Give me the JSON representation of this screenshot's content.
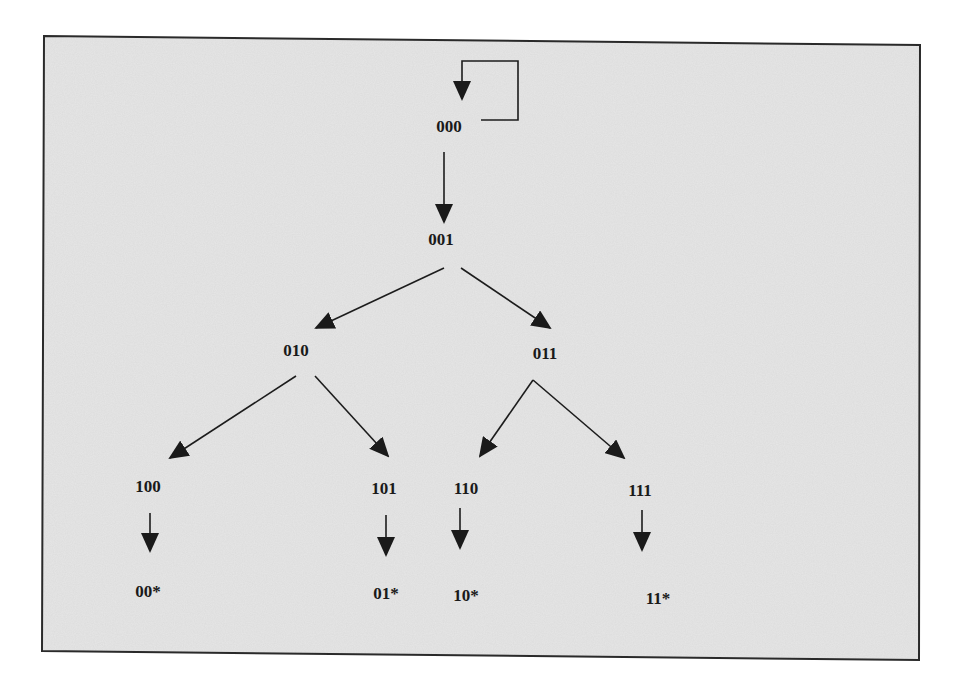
{
  "diagram": {
    "type": "state-transition-tree",
    "colors": {
      "background": "#dcdcdc",
      "page": "#ffffff",
      "ink": "#1a1a1a"
    },
    "nodes": [
      {
        "id": "n000",
        "label": "000",
        "x": 449,
        "y": 128
      },
      {
        "id": "n001",
        "label": "001",
        "x": 441,
        "y": 241
      },
      {
        "id": "n010",
        "label": "010",
        "x": 296,
        "y": 352
      },
      {
        "id": "n011",
        "label": "011",
        "x": 545,
        "y": 355
      },
      {
        "id": "n100",
        "label": "100",
        "x": 148,
        "y": 488
      },
      {
        "id": "n101",
        "label": "101",
        "x": 384,
        "y": 490
      },
      {
        "id": "n110",
        "label": "110",
        "x": 466,
        "y": 490
      },
      {
        "id": "n111",
        "label": "111",
        "x": 640,
        "y": 492
      },
      {
        "id": "n00s",
        "label": "00*",
        "x": 148,
        "y": 593
      },
      {
        "id": "n01s",
        "label": "01*",
        "x": 386,
        "y": 595
      },
      {
        "id": "n10s",
        "label": "10*",
        "x": 466,
        "y": 597
      },
      {
        "id": "n11s",
        "label": "11*",
        "x": 658,
        "y": 600
      }
    ],
    "edges": [
      {
        "from": "000",
        "to": "000",
        "kind": "self-loop"
      },
      {
        "from": "000",
        "to": "001"
      },
      {
        "from": "001",
        "to": "010"
      },
      {
        "from": "001",
        "to": "011"
      },
      {
        "from": "010",
        "to": "100"
      },
      {
        "from": "010",
        "to": "101"
      },
      {
        "from": "011",
        "to": "110"
      },
      {
        "from": "011",
        "to": "111"
      },
      {
        "from": "100",
        "to": "00*"
      },
      {
        "from": "101",
        "to": "01*"
      },
      {
        "from": "110",
        "to": "10*"
      },
      {
        "from": "111",
        "to": "11*"
      }
    ]
  },
  "labels": {
    "n000": "000",
    "n001": "001",
    "n010": "010",
    "n011": "011",
    "n100": "100",
    "n101": "101",
    "n110": "110",
    "n111": "111",
    "n00s": "00*",
    "n01s": "01*",
    "n10s": "10*",
    "n11s": "11*"
  }
}
